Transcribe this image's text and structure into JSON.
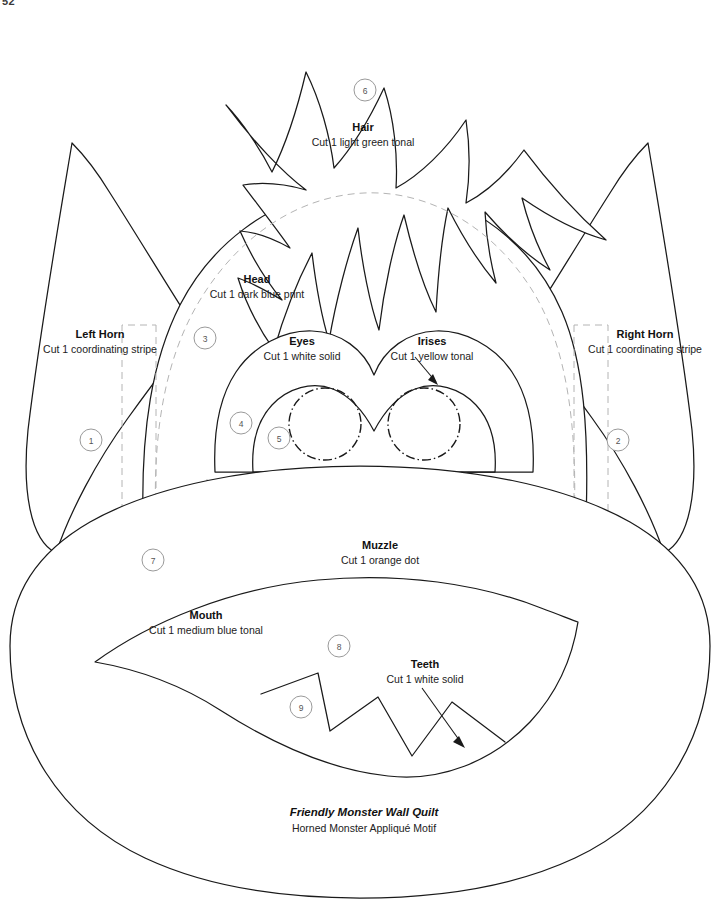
{
  "page": {
    "corner_mark": "52",
    "footer": {
      "title": "Friendly Monster Wall Quilt",
      "subtitle": "Horned Monster Appliqué Motif"
    }
  },
  "pieces": [
    {
      "key": "left_horn",
      "name": "Left Horn",
      "cut": "Cut 1 coordinating stripe",
      "number": "1",
      "label_x": 100,
      "label_y": 338,
      "badge_x": 91,
      "badge_y": 440
    },
    {
      "key": "right_horn",
      "name": "Right Horn",
      "cut": "Cut 1 coordinating stripe",
      "number": "2",
      "label_x": 645,
      "label_y": 338,
      "badge_x": 618,
      "badge_y": 440
    },
    {
      "key": "head",
      "name": "Head",
      "cut": "Cut 1 dark blue print",
      "number": "3",
      "label_x": 257,
      "label_y": 283,
      "badge_x": 205,
      "badge_y": 338
    },
    {
      "key": "eyes",
      "name": "Eyes",
      "cut": "Cut 1 white solid",
      "number": "4",
      "label_x": 302,
      "label_y": 345,
      "badge_x": 241,
      "badge_y": 423
    },
    {
      "key": "irises",
      "name": "Irises",
      "cut": "Cut 1 yellow tonal",
      "number": "5",
      "label_x": 432,
      "label_y": 345,
      "badge_x": 279,
      "badge_y": 438
    },
    {
      "key": "hair",
      "name": "Hair",
      "cut": "Cut 1 light green tonal",
      "number": "6",
      "label_x": 363,
      "label_y": 131,
      "badge_x": 365,
      "badge_y": 90
    },
    {
      "key": "muzzle",
      "name": "Muzzle",
      "cut": "Cut 1 orange dot",
      "number": "7",
      "label_x": 380,
      "label_y": 549,
      "badge_x": 153,
      "badge_y": 560
    },
    {
      "key": "mouth",
      "name": "Mouth",
      "cut": "Cut 1 medium blue tonal",
      "number": "8",
      "label_x": 206,
      "label_y": 619,
      "badge_x": 339,
      "badge_y": 646
    },
    {
      "key": "teeth",
      "name": "Teeth",
      "cut": "Cut 1 white solid",
      "number": "9",
      "label_x": 425,
      "label_y": 668,
      "badge_x": 301,
      "badge_y": 707
    }
  ],
  "colors": {
    "ink": "#1a1a1a",
    "guide": "#b4b4b4",
    "badge_stroke": "#9a9a9a",
    "paper": "#ffffff"
  }
}
